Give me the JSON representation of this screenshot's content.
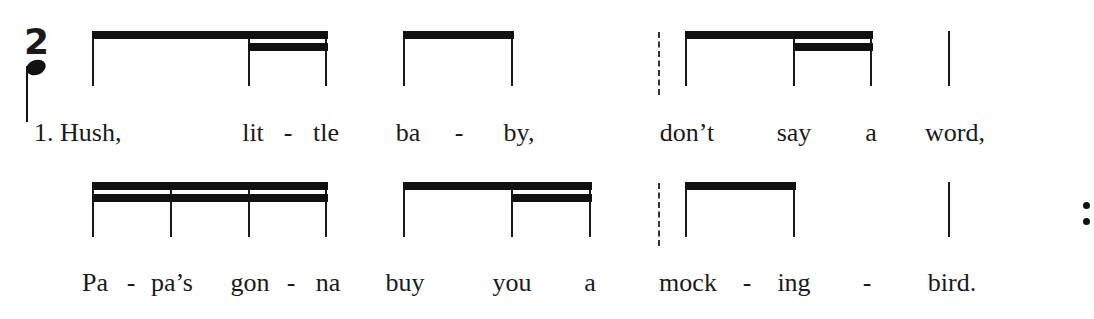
{
  "time_signature": {
    "numerator": "2",
    "denominator_symbol": "quarter-note"
  },
  "rows": [
    {
      "verse_label": "1.",
      "stems": [
        93,
        249,
        326,
        404,
        512,
        686,
        794,
        871,
        949
      ],
      "stem_top": 31,
      "stem_bottom": 86,
      "beams": [
        {
          "x1": 93,
          "x2": 328,
          "level": 1
        },
        {
          "x1": 249,
          "x2": 328,
          "level": 2
        },
        {
          "x1": 404,
          "x2": 514,
          "level": 1
        },
        {
          "x1": 686,
          "x2": 873,
          "level": 1
        },
        {
          "x1": 794,
          "x2": 873,
          "level": 2
        }
      ],
      "dashed_bars": [
        658
      ],
      "lyric_baseline": 141,
      "lyrics": [
        {
          "text": "1. Hush,",
          "x": 34,
          "align": "left"
        },
        {
          "text": "lit",
          "x": 253
        },
        {
          "text": "-",
          "x": 288
        },
        {
          "text": "tle",
          "x": 326
        },
        {
          "text": "ba",
          "x": 408
        },
        {
          "text": "-",
          "x": 459
        },
        {
          "text": "by,",
          "x": 519
        },
        {
          "text": "don’t",
          "x": 687
        },
        {
          "text": "say",
          "x": 794
        },
        {
          "text": "a",
          "x": 871
        },
        {
          "text": "word,",
          "x": 955
        }
      ]
    },
    {
      "stems": [
        93,
        171,
        249,
        326,
        404,
        512,
        590,
        686,
        794,
        949
      ],
      "stem_top": 182,
      "stem_bottom": 237,
      "beams": [
        {
          "x1": 93,
          "x2": 328,
          "level": 1
        },
        {
          "x1": 93,
          "x2": 328,
          "level": 2
        },
        {
          "x1": 404,
          "x2": 592,
          "level": 1
        },
        {
          "x1": 512,
          "x2": 592,
          "level": 2
        },
        {
          "x1": 686,
          "x2": 796,
          "level": 1
        }
      ],
      "dashed_bars": [
        658
      ],
      "repeat_dots": {
        "x": 1086,
        "y": [
          205,
          221
        ]
      },
      "lyric_baseline": 291,
      "lyrics": [
        {
          "text": "Pa",
          "x": 95
        },
        {
          "text": "-",
          "x": 131
        },
        {
          "text": "pa’s",
          "x": 172
        },
        {
          "text": "gon",
          "x": 250
        },
        {
          "text": "-",
          "x": 291
        },
        {
          "text": "na",
          "x": 328
        },
        {
          "text": "buy",
          "x": 405
        },
        {
          "text": "you",
          "x": 512
        },
        {
          "text": "a",
          "x": 590
        },
        {
          "text": "mock",
          "x": 688
        },
        {
          "text": "-",
          "x": 747
        },
        {
          "text": "ing",
          "x": 794
        },
        {
          "text": "-",
          "x": 867
        },
        {
          "text": "bird.",
          "x": 952
        }
      ]
    }
  ]
}
